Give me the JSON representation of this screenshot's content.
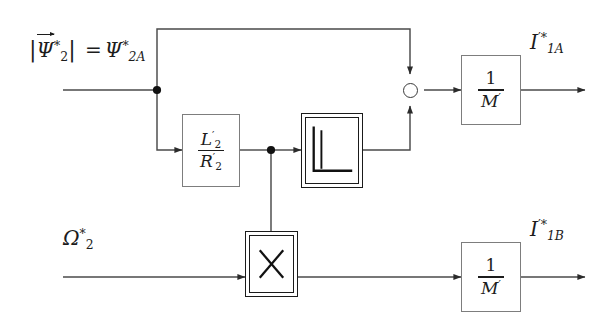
{
  "diagram": {
    "background_color": "#ffffff",
    "line_color": "#4a4a4a",
    "block_border_color": "#7d7d7d",
    "double_block_border_color": "#1a1a1a",
    "text_color": "#1c1c1c"
  },
  "inputs": [
    {
      "name": "flux-reference-input",
      "label_parts": {
        "bar_open": "|",
        "symbol": "Ψ",
        "symbol_sup": "*",
        "symbol_sub": "2",
        "bar_close": "|",
        "equals": "=",
        "rhs_symbol": "Ψ",
        "rhs_sup": "*",
        "rhs_sub": "2A"
      },
      "label_plain": "|Ψ⃗₂*| = Ψ₂ₐ*"
    },
    {
      "name": "speed-reference-input",
      "label_parts": {
        "symbol": "Ω",
        "symbol_sup": "*",
        "symbol_sub": "2"
      },
      "label_plain": "Ω₂*"
    }
  ],
  "blocks": [
    {
      "id": "time-constant-block",
      "type": "gain",
      "numerator_symbol": "L",
      "numerator_prime": "′",
      "numerator_sub": "2",
      "denominator_symbol": "R",
      "denominator_prime": "′",
      "denominator_sub": "2",
      "label_plain": "L′₂ / R′₂"
    },
    {
      "id": "derivative-block",
      "type": "derivative",
      "icon": "step-derivative-icon",
      "label_plain": "d/dt (step response icon)"
    },
    {
      "id": "multiplier-block",
      "type": "multiplier",
      "icon": "multiply-icon",
      "label_plain": "×"
    },
    {
      "id": "gain-block-a",
      "type": "gain",
      "numerator": "1",
      "denominator_symbol": "M",
      "denominator_prime": "′",
      "label_plain": "1 / M′"
    },
    {
      "id": "gain-block-b",
      "type": "gain",
      "numerator": "1",
      "denominator_symbol": "M",
      "denominator_prime": "′",
      "label_plain": "1 / M′"
    }
  ],
  "summing_junction": {
    "id": "sum-junction",
    "shape": "circle",
    "inputs": [
      "top",
      "bottom"
    ],
    "output": "right"
  },
  "outputs": [
    {
      "name": "current-output-a",
      "symbol": "I",
      "prime": "′",
      "star": "*",
      "subscript": "1A",
      "label_plain": "I′*₁ₐ"
    },
    {
      "name": "current-output-b",
      "symbol": "I",
      "prime": "′",
      "star": "*",
      "subscript": "1B",
      "label_plain": "I′*₁ᵦ"
    }
  ]
}
